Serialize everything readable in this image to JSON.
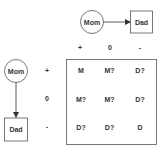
{
  "top_graph": {
    "source": {
      "label": "Mom",
      "shape": "circle"
    },
    "target": {
      "label": "Dad",
      "shape": "box"
    },
    "edge": "directed"
  },
  "left_graph": {
    "source": {
      "label": "Mom",
      "shape": "circle"
    },
    "target": {
      "label": "Dad",
      "shape": "box"
    },
    "edge": "directed"
  },
  "column_headers": [
    "+",
    "0",
    "-"
  ],
  "row_headers": [
    "+",
    "0",
    "-"
  ],
  "matrix": [
    [
      "M",
      "M?",
      "D?"
    ],
    [
      "M?",
      "M?",
      "D?"
    ],
    [
      "D?",
      "D?",
      "D"
    ]
  ],
  "colors": {
    "stroke": "#555555",
    "text": "#333333",
    "background": "#ffffff"
  }
}
